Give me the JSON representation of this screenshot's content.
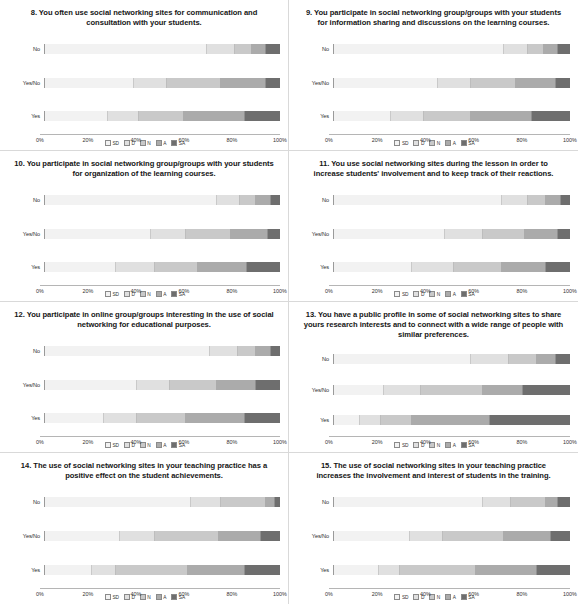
{
  "figure": {
    "categories": [
      "No",
      "Yes/No",
      "Yes"
    ],
    "axis_ticks": [
      "0%",
      "20%",
      "40%",
      "60%",
      "80%",
      "100%"
    ],
    "legend": [
      {
        "key": "sd",
        "label": "SD",
        "color": "#f2f2f2"
      },
      {
        "key": "d",
        "label": "D",
        "color": "#e0e0e0"
      },
      {
        "key": "n",
        "label": "N",
        "color": "#c9c9c9"
      },
      {
        "key": "a",
        "label": "A",
        "color": "#ababab"
      },
      {
        "key": "sa",
        "label": "SA",
        "color": "#6e6e6e"
      }
    ]
  },
  "charts": [
    {
      "id": "q8",
      "title": "8. You often use social networking sites for communication and consultation with your students.",
      "type": "bar",
      "orientation": "horizontal",
      "stacked": true,
      "categories": [
        "No",
        "Yes/No",
        "Yes"
      ],
      "series": [
        {
          "name": "SD",
          "values": [
            69,
            38,
            27
          ]
        },
        {
          "name": "D",
          "values": [
            12,
            14,
            13
          ]
        },
        {
          "name": "N",
          "values": [
            7,
            23,
            19
          ]
        },
        {
          "name": "A",
          "values": [
            6,
            19,
            26
          ]
        },
        {
          "name": "SA",
          "values": [
            6,
            6,
            15
          ]
        }
      ],
      "xlabel": "",
      "ylabel": "",
      "xlim": [
        0,
        100
      ]
    },
    {
      "id": "q9",
      "title": "9. You participate in social networking group/groups with your students for information sharing and discussions on the learning courses.",
      "type": "bar",
      "orientation": "horizontal",
      "stacked": true,
      "categories": [
        "No",
        "Yes/No",
        "Yes"
      ],
      "series": [
        {
          "name": "SD",
          "values": [
            72,
            44,
            24
          ]
        },
        {
          "name": "D",
          "values": [
            10,
            14,
            14
          ]
        },
        {
          "name": "N",
          "values": [
            7,
            19,
            20
          ]
        },
        {
          "name": "A",
          "values": [
            6,
            17,
            26
          ]
        },
        {
          "name": "SA",
          "values": [
            5,
            6,
            16
          ]
        }
      ],
      "xlabel": "",
      "ylabel": "",
      "xlim": [
        0,
        100
      ]
    },
    {
      "id": "q10",
      "title": "10. You participate in social networking group/groups with your students for organization of the learning courses.",
      "type": "bar",
      "orientation": "horizontal",
      "stacked": true,
      "categories": [
        "No",
        "Yes/No",
        "Yes"
      ],
      "series": [
        {
          "name": "SD",
          "values": [
            73,
            45,
            30
          ]
        },
        {
          "name": "D",
          "values": [
            10,
            15,
            17
          ]
        },
        {
          "name": "N",
          "values": [
            7,
            19,
            18
          ]
        },
        {
          "name": "A",
          "values": [
            6,
            16,
            21
          ]
        },
        {
          "name": "SA",
          "values": [
            4,
            5,
            14
          ]
        }
      ],
      "xlabel": "",
      "ylabel": "",
      "xlim": [
        0,
        100
      ]
    },
    {
      "id": "q11",
      "title": "11. You use social networking sites during the lesson in order to increase students' involvement and to keep track of their reactions.",
      "type": "bar",
      "orientation": "horizontal",
      "stacked": true,
      "categories": [
        "No",
        "Yes/No",
        "Yes"
      ],
      "series": [
        {
          "name": "SD",
          "values": [
            71,
            47,
            33
          ]
        },
        {
          "name": "D",
          "values": [
            11,
            16,
            18
          ]
        },
        {
          "name": "N",
          "values": [
            8,
            18,
            20
          ]
        },
        {
          "name": "A",
          "values": [
            6,
            14,
            19
          ]
        },
        {
          "name": "SA",
          "values": [
            4,
            5,
            10
          ]
        }
      ],
      "xlabel": "",
      "ylabel": "",
      "xlim": [
        0,
        100
      ]
    },
    {
      "id": "q12",
      "title": "12. You participate in online group/groups interesting in the use of social networking for educational purposes.",
      "type": "bar",
      "orientation": "horizontal",
      "stacked": true,
      "categories": [
        "No",
        "Yes/No",
        "Yes"
      ],
      "series": [
        {
          "name": "SD",
          "values": [
            70,
            39,
            25
          ]
        },
        {
          "name": "D",
          "values": [
            12,
            14,
            14
          ]
        },
        {
          "name": "N",
          "values": [
            8,
            20,
            21
          ]
        },
        {
          "name": "A",
          "values": [
            6,
            17,
            25
          ]
        },
        {
          "name": "SA",
          "values": [
            4,
            10,
            15
          ]
        }
      ],
      "xlabel": "",
      "ylabel": "",
      "xlim": [
        0,
        100
      ]
    },
    {
      "id": "q13",
      "title": "13. You have a public profile in some of social networking sites to share yours research interests and to connect with a wide range of people with similar preferences.",
      "type": "bar",
      "orientation": "horizontal",
      "stacked": true,
      "categories": [
        "No",
        "Yes/No",
        "Yes"
      ],
      "series": [
        {
          "name": "SD",
          "values": [
            58,
            21,
            11
          ]
        },
        {
          "name": "D",
          "values": [
            16,
            16,
            9
          ]
        },
        {
          "name": "N",
          "values": [
            12,
            26,
            13
          ]
        },
        {
          "name": "A",
          "values": [
            8,
            17,
            33
          ]
        },
        {
          "name": "SA",
          "values": [
            6,
            20,
            34
          ]
        }
      ],
      "xlabel": "",
      "ylabel": "",
      "xlim": [
        0,
        100
      ]
    },
    {
      "id": "q14",
      "title": "14. The use of social networking sites in your teaching practice has a positive effect on the student achievements.",
      "type": "bar",
      "orientation": "horizontal",
      "stacked": true,
      "categories": [
        "No",
        "Yes/No",
        "Yes"
      ],
      "series": [
        {
          "name": "SD",
          "values": [
            62,
            32,
            20
          ]
        },
        {
          "name": "D",
          "values": [
            13,
            15,
            10
          ]
        },
        {
          "name": "N",
          "values": [
            19,
            27,
            31
          ]
        },
        {
          "name": "A",
          "values": [
            4,
            18,
            24
          ]
        },
        {
          "name": "SA",
          "values": [
            2,
            8,
            15
          ]
        }
      ],
      "xlabel": "",
      "ylabel": "",
      "xlim": [
        0,
        100
      ]
    },
    {
      "id": "q15",
      "title": "15. The use of social networking sites in your teaching practice increases the involvement and interest of students in the training.",
      "type": "bar",
      "orientation": "horizontal",
      "stacked": true,
      "categories": [
        "No",
        "Yes/No",
        "Yes"
      ],
      "series": [
        {
          "name": "SD",
          "values": [
            63,
            32,
            19
          ]
        },
        {
          "name": "D",
          "values": [
            12,
            14,
            9
          ]
        },
        {
          "name": "N",
          "values": [
            15,
            26,
            32
          ]
        },
        {
          "name": "A",
          "values": [
            5,
            20,
            26
          ]
        },
        {
          "name": "SA",
          "values": [
            5,
            8,
            14
          ]
        }
      ],
      "xlabel": "",
      "ylabel": "",
      "xlim": [
        0,
        100
      ]
    }
  ],
  "chart_data": {
    "type": "bar",
    "orientation": "horizontal",
    "stacked": true,
    "percent": true,
    "grid": false,
    "legend_position": "bottom",
    "legend_entries": [
      "SD",
      "D",
      "N",
      "A",
      "SA"
    ],
    "xlabel": "",
    "ylabel": "",
    "xlim": [
      0,
      100
    ],
    "xticks": [
      "0%",
      "20%",
      "40%",
      "60%",
      "80%",
      "100%"
    ],
    "categories": [
      "No",
      "Yes/No",
      "Yes"
    ],
    "panels": [
      {
        "title": "8. You often use social networking sites for communication and consultation with your students.",
        "series": [
          {
            "name": "SD",
            "values": [
              69,
              38,
              27
            ]
          },
          {
            "name": "D",
            "values": [
              12,
              14,
              13
            ]
          },
          {
            "name": "N",
            "values": [
              7,
              23,
              19
            ]
          },
          {
            "name": "A",
            "values": [
              6,
              19,
              26
            ]
          },
          {
            "name": "SA",
            "values": [
              6,
              6,
              15
            ]
          }
        ]
      },
      {
        "title": "9. You participate in social networking group/groups with your students for information sharing and discussions on the learning courses.",
        "series": [
          {
            "name": "SD",
            "values": [
              72,
              44,
              24
            ]
          },
          {
            "name": "D",
            "values": [
              10,
              14,
              14
            ]
          },
          {
            "name": "N",
            "values": [
              7,
              19,
              20
            ]
          },
          {
            "name": "A",
            "values": [
              6,
              17,
              26
            ]
          },
          {
            "name": "SA",
            "values": [
              5,
              6,
              16
            ]
          }
        ]
      },
      {
        "title": "10. You participate in social networking group/groups with your students for organization of the learning courses.",
        "series": [
          {
            "name": "SD",
            "values": [
              73,
              45,
              30
            ]
          },
          {
            "name": "D",
            "values": [
              10,
              15,
              17
            ]
          },
          {
            "name": "N",
            "values": [
              7,
              19,
              18
            ]
          },
          {
            "name": "A",
            "values": [
              6,
              16,
              21
            ]
          },
          {
            "name": "SA",
            "values": [
              4,
              5,
              14
            ]
          }
        ]
      },
      {
        "title": "11. You use social networking sites during the lesson in order to increase students' involvement and to keep track of their reactions.",
        "series": [
          {
            "name": "SD",
            "values": [
              71,
              47,
              33
            ]
          },
          {
            "name": "D",
            "values": [
              11,
              16,
              18
            ]
          },
          {
            "name": "N",
            "values": [
              8,
              18,
              20
            ]
          },
          {
            "name": "A",
            "values": [
              6,
              14,
              19
            ]
          },
          {
            "name": "SA",
            "values": [
              4,
              5,
              10
            ]
          }
        ]
      },
      {
        "title": "12. You participate in online group/groups interesting in the use of social networking for educational purposes.",
        "series": [
          {
            "name": "SD",
            "values": [
              70,
              39,
              25
            ]
          },
          {
            "name": "D",
            "values": [
              12,
              14,
              14
            ]
          },
          {
            "name": "N",
            "values": [
              8,
              20,
              21
            ]
          },
          {
            "name": "A",
            "values": [
              6,
              17,
              25
            ]
          },
          {
            "name": "SA",
            "values": [
              4,
              10,
              15
            ]
          }
        ]
      },
      {
        "title": "13. You have a public profile in some of social networking sites to share yours research interests and to connect with a wide range of people with similar preferences.",
        "series": [
          {
            "name": "SD",
            "values": [
              58,
              21,
              11
            ]
          },
          {
            "name": "D",
            "values": [
              16,
              16,
              9
            ]
          },
          {
            "name": "N",
            "values": [
              12,
              26,
              13
            ]
          },
          {
            "name": "A",
            "values": [
              8,
              17,
              33
            ]
          },
          {
            "name": "SA",
            "values": [
              6,
              20,
              34
            ]
          }
        ]
      },
      {
        "title": "14. The use of social networking sites in your teaching practice has a positive effect on the student achievements.",
        "series": [
          {
            "name": "SD",
            "values": [
              62,
              32,
              20
            ]
          },
          {
            "name": "D",
            "values": [
              13,
              15,
              10
            ]
          },
          {
            "name": "N",
            "values": [
              19,
              27,
              31
            ]
          },
          {
            "name": "A",
            "values": [
              4,
              18,
              24
            ]
          },
          {
            "name": "SA",
            "values": [
              2,
              8,
              15
            ]
          }
        ]
      },
      {
        "title": "15. The use of social networking sites in your teaching practice increases the involvement and interest of students in the training.",
        "series": [
          {
            "name": "SD",
            "values": [
              63,
              32,
              19
            ]
          },
          {
            "name": "D",
            "values": [
              12,
              14,
              9
            ]
          },
          {
            "name": "N",
            "values": [
              15,
              26,
              32
            ]
          },
          {
            "name": "A",
            "values": [
              5,
              20,
              26
            ]
          },
          {
            "name": "SA",
            "values": [
              5,
              8,
              14
            ]
          }
        ]
      }
    ]
  }
}
